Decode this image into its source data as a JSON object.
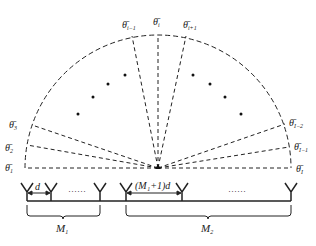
{
  "diagram": {
    "angle_labels_left": [
      {
        "base": "θ̄",
        "sub": "1"
      },
      {
        "base": "θ̄",
        "sub": "2"
      },
      {
        "base": "θ̄",
        "sub": "3"
      }
    ],
    "angle_labels_top": [
      {
        "base": "θ̄",
        "sub": "i−1"
      },
      {
        "base": "θ̄",
        "sub": "i"
      },
      {
        "base": "θ̄",
        "sub": "i+1"
      }
    ],
    "angle_labels_right": [
      {
        "base": "θ̄",
        "sub": "I−2"
      },
      {
        "base": "θ̄",
        "sub": "I−1"
      },
      {
        "base": "θ̄",
        "sub": "I"
      }
    ],
    "spacing_label_1": "d",
    "spacing_label_2": "(M₁+1)d",
    "ellipsis_1": "……",
    "ellipsis_2": "……",
    "subarray_1": {
      "base": "M",
      "sub": "1"
    },
    "subarray_2": {
      "base": "M",
      "sub": "2"
    },
    "line_color": "#222222"
  }
}
